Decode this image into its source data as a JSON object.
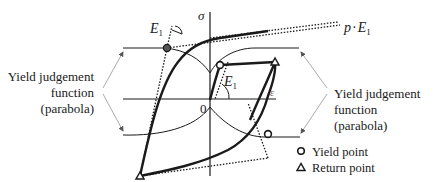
{
  "diagram": {
    "axes": {
      "vertical_label": "σ",
      "horizontal_label": "ε",
      "origin_label": "0"
    },
    "labels": {
      "E1_top_base": "E",
      "E1_top_sub": "1",
      "E1_center_base": "E",
      "E1_center_sub": "1",
      "pE1_p": "p",
      "pE1_dot": "·",
      "pE1_E": "E",
      "pE1_sub": "1"
    },
    "annotations": {
      "left": {
        "line1": "Yield judgement",
        "line2": "function",
        "line3": "(parabola)"
      },
      "right": {
        "line1": "Yield judgement",
        "line2": "function",
        "line3": "(parabola)"
      }
    },
    "legend": [
      {
        "symbol": "circle",
        "label": "Yield point"
      },
      {
        "symbol": "triangle",
        "label": "Return point"
      }
    ],
    "colors": {
      "line": "#1a1a1a",
      "arrow": "#9a9a9a",
      "background": "#ffffff"
    }
  }
}
